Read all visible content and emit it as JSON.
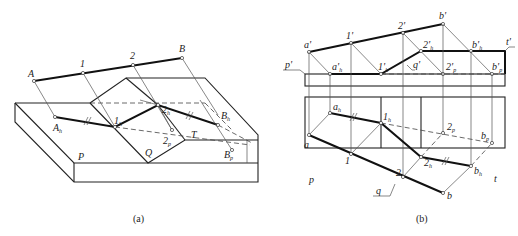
{
  "figure_a": {
    "caption": "(a)",
    "labels": {
      "A": "A",
      "one": "1",
      "two": "2",
      "B": "B",
      "A_h": "A",
      "A_h_sub": "h",
      "one_h": "1",
      "one_h_sub": "h",
      "two_h": "2",
      "two_h_sub": "h",
      "B_h": "B",
      "B_h_sub": "h",
      "two_p": "2",
      "two_p_sub": "p",
      "B_p": "B",
      "B_p_sub": "p",
      "P": "P",
      "Q": "Q",
      "T": "T"
    }
  },
  "figure_b": {
    "caption": "(b)",
    "labels": {
      "a_prime": "a'",
      "one_prime": "1'",
      "two_prime": "2'",
      "b_prime": "b'",
      "p_prime": "p'",
      "t_prime": "t'",
      "q_prime": "q'",
      "a_h_prime": "a'",
      "a_h_prime_sub": "h",
      "one_h_prime": "1'",
      "one_h_prime_sub": "h",
      "two_h_prime": "2'",
      "two_h_prime_sub": "h",
      "b_h_prime": "b'",
      "b_h_prime_sub": "h",
      "two_p_prime": "2'",
      "two_p_prime_sub": "p",
      "b_p_prime": "b'",
      "b_p_prime_sub": "p",
      "a": "a",
      "one": "1",
      "two": "2",
      "b": "b",
      "a_h": "a",
      "a_h_sub": "h",
      "one_h": "1",
      "one_h_sub": "h",
      "two_h": "2",
      "two_h_sub": "h",
      "b_h": "b",
      "b_h_sub": "h",
      "two_p": "2",
      "two_p_sub": "p",
      "b_p": "b",
      "b_p_sub": "p",
      "p": "p",
      "q": "q",
      "t": "t"
    }
  }
}
